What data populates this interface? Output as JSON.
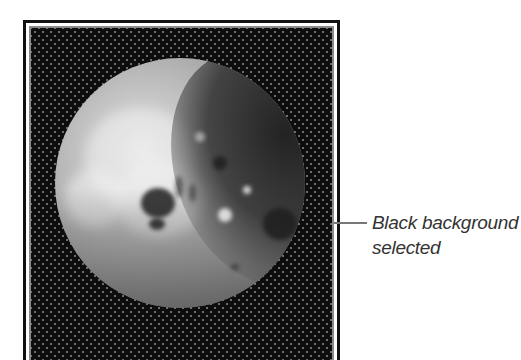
{
  "figure": {
    "preview": {
      "background": "black",
      "fill_color": "#0d0d0d",
      "dot_color": "#6e6e6e",
      "frame_color": "#111111",
      "inner_frame_color": "#8a8a8a",
      "image_subject": "moon"
    },
    "callout": {
      "line1": "Black background",
      "line2": "selected",
      "leader_color": "#777777",
      "text_color": "#333333"
    }
  }
}
